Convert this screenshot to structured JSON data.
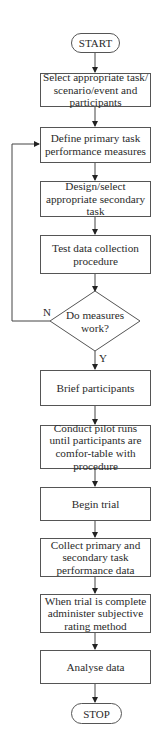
{
  "flowchart": {
    "start": "START",
    "stop": "STOP",
    "steps": [
      "Select appropriate task/ scenario/event and participants",
      "Define primary task performance measures",
      "Design/select appropriate secondary task",
      "Test data collection procedure",
      "Brief participants",
      "Conduct pilot runs until participants are comfor-table with procedure",
      "Begin trial",
      "Collect primary and secondary task performance data",
      "When trial is complete administer subjective rating method",
      "Analyse data"
    ],
    "decision": {
      "question": "Do measures work?",
      "no_label": "N",
      "yes_label": "Y"
    }
  }
}
